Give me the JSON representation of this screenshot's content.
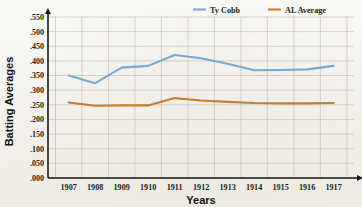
{
  "chart_data": {
    "type": "line",
    "title": "",
    "xlabel": "Years",
    "ylabel": "Batting Averages",
    "x": [
      1907,
      1908,
      1909,
      1910,
      1911,
      1912,
      1913,
      1914,
      1915,
      1916,
      1917
    ],
    "categories": [
      "1907",
      "1908",
      "1909",
      "1910",
      "1911",
      "1912",
      "1913",
      "1914",
      "1915",
      "1916",
      "1917"
    ],
    "ylim": [
      0.0,
      0.55
    ],
    "ytick_labels": [
      ".000",
      ".050",
      ".100",
      ".150",
      ".200",
      ".250",
      ".300",
      ".350",
      ".400",
      ".450",
      ".500",
      ".550"
    ],
    "ytick_values": [
      0.0,
      0.05,
      0.1,
      0.15,
      0.2,
      0.25,
      0.3,
      0.35,
      0.4,
      0.45,
      0.5,
      0.55
    ],
    "grid": true,
    "legend_position": "top-right",
    "series": [
      {
        "name": "Ty Cobb",
        "color": "#7aa9cf",
        "values": [
          0.35,
          0.324,
          0.377,
          0.383,
          0.42,
          0.409,
          0.39,
          0.368,
          0.369,
          0.371,
          0.383
        ]
      },
      {
        "name": "AL Average",
        "color": "#cc7a2e",
        "values": [
          0.258,
          0.247,
          0.248,
          0.248,
          0.273,
          0.265,
          0.26,
          0.256,
          0.255,
          0.255,
          0.256
        ]
      }
    ]
  },
  "legend": {
    "items": [
      {
        "label": "Ty Cobb",
        "color": "#7aa9cf"
      },
      {
        "label": "AL Average",
        "color": "#cc7a2e"
      }
    ]
  },
  "axes": {
    "y_title": "Batting Averages",
    "x_title": "Years"
  }
}
